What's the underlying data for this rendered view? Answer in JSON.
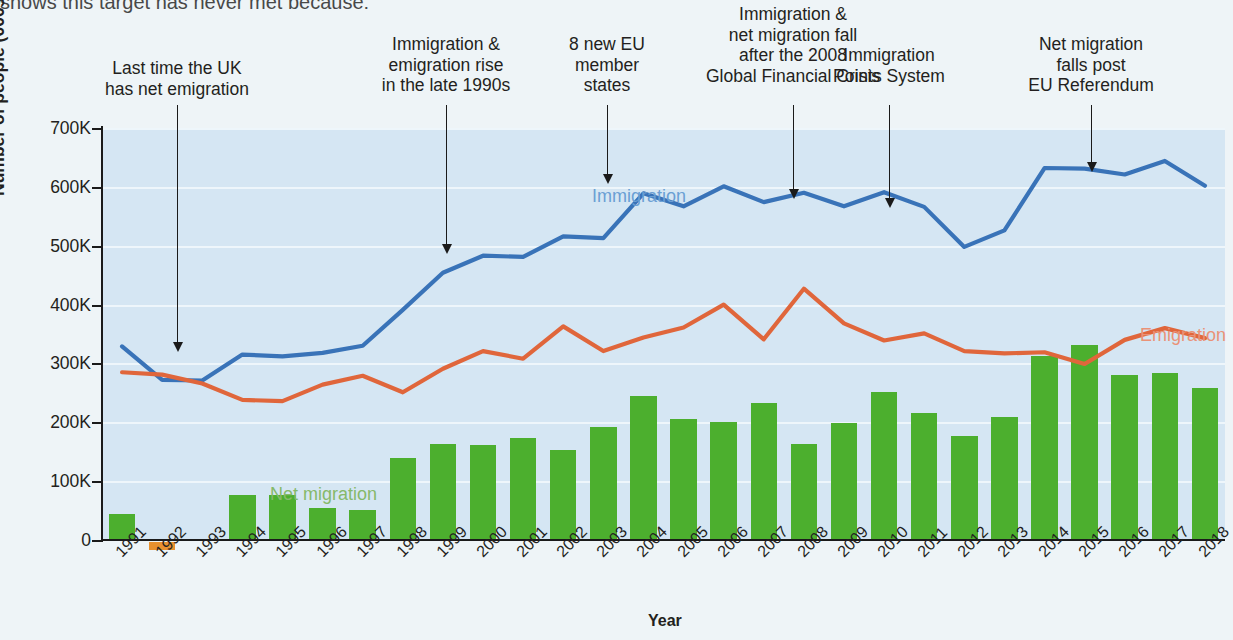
{
  "top_fragment": "shows this target has never met because:",
  "chart_data": {
    "type": "line",
    "title": "",
    "xlabel": "Year",
    "ylabel": "Number of people (000s)",
    "ylim": [
      0,
      700000
    ],
    "ytick_labels": [
      "700K",
      "600K",
      "500K",
      "400K",
      "300K",
      "200K",
      "100K",
      "0"
    ],
    "ytick_values": [
      700000,
      600000,
      500000,
      400000,
      300000,
      200000,
      100000,
      0
    ],
    "grid": true,
    "legend": "inline-labels",
    "categories": [
      "1991",
      "1992",
      "1993",
      "1994",
      "1995",
      "1996",
      "1997",
      "1998",
      "1999",
      "2000",
      "2001",
      "2002",
      "2003",
      "2004",
      "2005",
      "2006",
      "2007",
      "2008",
      "2009",
      "2010",
      "2011",
      "2012",
      "2013",
      "2014",
      "2015",
      "2016",
      "2017",
      "2018"
    ],
    "series": [
      {
        "name": "Immigration",
        "color": "#3973b8",
        "type": "line",
        "values": [
          329000,
          272000,
          271000,
          315000,
          312000,
          318000,
          330000,
          391000,
          454000,
          483000,
          481000,
          516000,
          513000,
          589000,
          567000,
          601000,
          574000,
          590000,
          567000,
          591000,
          566000,
          498000,
          526000,
          632000,
          631000,
          621000,
          644000,
          602000
        ]
      },
      {
        "name": "Emigration",
        "color": "#e0663b",
        "type": "line",
        "values": [
          285000,
          281000,
          266000,
          238000,
          236000,
          264000,
          279000,
          251000,
          291000,
          321000,
          308000,
          363000,
          321000,
          344000,
          361000,
          400000,
          341000,
          427000,
          368000,
          339000,
          351000,
          321000,
          317000,
          319000,
          299000,
          340000,
          360000,
          343000
        ]
      },
      {
        "name": "Net migration",
        "color": "#4caf2e",
        "negative_color": "#e8912f",
        "type": "bar",
        "values": [
          44000,
          -13000,
          0,
          77000,
          76000,
          54000,
          51000,
          140000,
          163000,
          162000,
          173000,
          153000,
          192000,
          245000,
          206000,
          201000,
          233000,
          163000,
          199000,
          252000,
          215000,
          177000,
          209000,
          313000,
          332000,
          281000,
          284000,
          259000
        ]
      }
    ],
    "series_labels": [
      {
        "name": "Immigration",
        "color": "#6a9fd4",
        "x": 592,
        "y": 186
      },
      {
        "name": "Emigration",
        "color": "#ea9277",
        "x": 1140,
        "y": 325
      },
      {
        "name": "Net migration",
        "color": "#86b96a",
        "x": 270,
        "y": 484
      }
    ],
    "annotations": [
      {
        "id": "ann-last-net-emigration",
        "text": "Last time the UK\nhas net emigration",
        "text_x": 177,
        "text_y": 58,
        "arrow_x": 177,
        "arrow_top": 105,
        "arrow_height": 238
      },
      {
        "id": "ann-late-1990s-rise",
        "text": "Immigration &\nemigration rise\nin the late 1990s",
        "text_x": 446,
        "text_y": 34,
        "arrow_x": 446,
        "arrow_top": 105,
        "arrow_height": 140
      },
      {
        "id": "ann-8-new-eu-states",
        "text": "8 new EU\nmember\nstates",
        "text_x": 607,
        "text_y": 34,
        "arrow_x": 607,
        "arrow_top": 105,
        "arrow_height": 70
      },
      {
        "id": "ann-2008-financial-crisis",
        "text": "Immigration &\nnet migration fall\nafter the 2008\nGlobal Financial Crisis",
        "text_x": 793,
        "text_y": 4,
        "arrow_x": 793,
        "arrow_top": 105,
        "arrow_height": 85
      },
      {
        "id": "ann-points-system",
        "text": "Immigration\nPoints System",
        "text_x": 889,
        "text_y": 45,
        "arrow_x": 889,
        "arrow_top": 105,
        "arrow_height": 94
      },
      {
        "id": "ann-eu-referendum",
        "text": "Net migration\nfalls post\nEU Referendum",
        "text_x": 1091,
        "text_y": 34,
        "arrow_x": 1091,
        "arrow_top": 105,
        "arrow_height": 58
      }
    ]
  }
}
